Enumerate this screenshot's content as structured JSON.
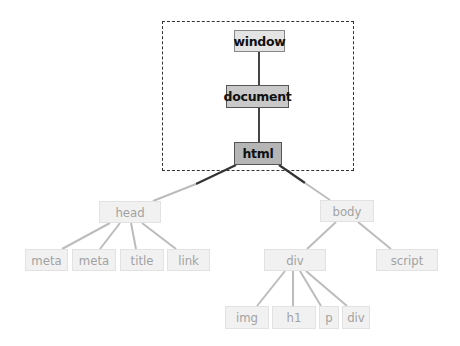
{
  "diagram": {
    "title": "",
    "highlight_region": {
      "label": "",
      "contains": [
        "window",
        "document",
        "html"
      ]
    },
    "nodes": {
      "window": {
        "label": "window",
        "x": 234,
        "y": 30,
        "w": 51,
        "h": 22,
        "style": "active"
      },
      "document": {
        "label": "document",
        "x": 226,
        "y": 85,
        "w": 63,
        "h": 23,
        "style": "active"
      },
      "html": {
        "label": "html",
        "x": 234,
        "y": 142,
        "w": 48,
        "h": 23,
        "style": "active"
      },
      "head": {
        "label": "head",
        "x": 99,
        "y": 201,
        "w": 62,
        "h": 22,
        "style": "faded"
      },
      "body": {
        "label": "body",
        "x": 320,
        "y": 200,
        "w": 54,
        "h": 22,
        "style": "faded"
      },
      "meta1": {
        "label": "meta",
        "x": 25,
        "y": 249,
        "w": 43,
        "h": 22,
        "style": "faded"
      },
      "meta2": {
        "label": "meta",
        "x": 72,
        "y": 249,
        "w": 44,
        "h": 22,
        "style": "faded"
      },
      "title": {
        "label": "title",
        "x": 120,
        "y": 249,
        "w": 44,
        "h": 22,
        "style": "faded"
      },
      "link": {
        "label": "link",
        "x": 167,
        "y": 249,
        "w": 43,
        "h": 22,
        "style": "faded"
      },
      "div": {
        "label": "div",
        "x": 264,
        "y": 249,
        "w": 62,
        "h": 22,
        "style": "faded"
      },
      "script": {
        "label": "script",
        "x": 376,
        "y": 249,
        "w": 62,
        "h": 22,
        "style": "faded"
      },
      "img": {
        "label": "img",
        "x": 225,
        "y": 306,
        "w": 44,
        "h": 23,
        "style": "faded"
      },
      "h1": {
        "label": "h1",
        "x": 272,
        "y": 306,
        "w": 44,
        "h": 23,
        "style": "faded"
      },
      "p": {
        "label": "p",
        "x": 319,
        "y": 306,
        "w": 20,
        "h": 23,
        "style": "faded"
      },
      "div2": {
        "label": "div",
        "x": 342,
        "y": 306,
        "w": 28,
        "h": 23,
        "style": "faded"
      }
    },
    "edges": [
      [
        "window",
        "document"
      ],
      [
        "document",
        "html"
      ],
      [
        "html",
        "head"
      ],
      [
        "html",
        "body"
      ],
      [
        "head",
        "meta1"
      ],
      [
        "head",
        "meta2"
      ],
      [
        "head",
        "title"
      ],
      [
        "head",
        "link"
      ],
      [
        "body",
        "div"
      ],
      [
        "body",
        "script"
      ],
      [
        "div",
        "img"
      ],
      [
        "div",
        "h1"
      ],
      [
        "div",
        "p"
      ],
      [
        "div",
        "div2"
      ]
    ],
    "colors": {
      "active_edge": "#444444",
      "faded_edge": "#b8b8b8",
      "dashed_border": "#333333"
    }
  }
}
